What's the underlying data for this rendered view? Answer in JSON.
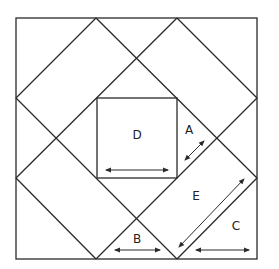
{
  "diagram": {
    "labels": {
      "A": "A",
      "B": "B",
      "C": "C",
      "D": "D",
      "E": "E"
    },
    "colors": {
      "line": "#2a2a2a",
      "background": "#ffffff"
    }
  }
}
